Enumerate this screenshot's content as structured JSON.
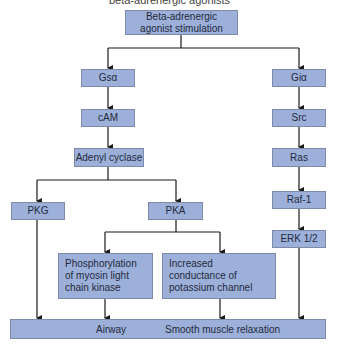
{
  "caption": "beta-adrenergic agonists",
  "top": {
    "label": "Beta-adrenergic\nagonist stimulation"
  },
  "left_column": [
    {
      "id": "gsa",
      "label": "Gsα"
    },
    {
      "id": "cam",
      "label": "cAM"
    },
    {
      "id": "adenyl",
      "label": "Adenyl cyclase"
    }
  ],
  "right_column": [
    {
      "id": "gia",
      "label": "Giα"
    },
    {
      "id": "src",
      "label": "Src"
    },
    {
      "id": "ras",
      "label": "Ras"
    },
    {
      "id": "raf1",
      "label": "Raf-1"
    },
    {
      "id": "erk",
      "label": "ERK 1/2"
    }
  ],
  "kinases": {
    "pkg": "PKG",
    "pka": "PKA"
  },
  "effects": {
    "phosphorylation": "Phosphorylation of myosin light chain kinase",
    "potassium": "Increased conductance of potassium channel"
  },
  "outcome": {
    "left": "Airway",
    "right": "Smooth muscle relaxation"
  },
  "colors": {
    "box_fill": "#9db0da",
    "box_border": "#7e8aa8",
    "line": "#1a1a1a"
  }
}
